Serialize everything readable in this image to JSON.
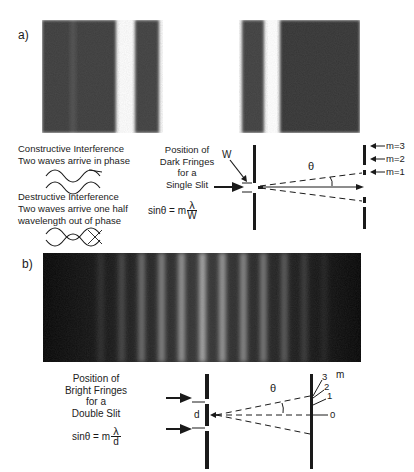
{
  "panel_a": {
    "label": "a)",
    "fringe_image": "single-slit diffraction pattern",
    "constructive": {
      "title": "Constructive Interference",
      "subtitle": "Two waves arrive in phase"
    },
    "destructive": {
      "title": "Destructive Interference",
      "subtitle_line1": "Two waves arrive one half",
      "subtitle_line2": "wavelength out of phase"
    },
    "caption": {
      "line1": "Position of",
      "line2": "Dark Fringes",
      "line3": "for a",
      "line4": "Single Slit"
    },
    "equation": {
      "lhs": "sinθ = m",
      "numerator": "λ",
      "denominator": "W"
    },
    "diagram": {
      "slit_label": "W",
      "angle_label": "θ",
      "orders": [
        "m=3",
        "m=2",
        "m=1"
      ]
    }
  },
  "panel_b": {
    "label": "b)",
    "fringe_image": "double-slit interference pattern",
    "caption": {
      "line1": "Position of",
      "line2": "Bright Fringes",
      "line3": "for a",
      "line4": "Double Slit"
    },
    "equation": {
      "lhs": "sinθ = m",
      "numerator": "λ",
      "denominator": "d"
    },
    "diagram": {
      "slit_label": "d",
      "angle_label": "θ",
      "order_axis_label": "m",
      "orders": [
        "3",
        "2",
        "1",
        "0"
      ]
    }
  },
  "colors": {
    "dark_fringe": "#3a3a3a",
    "bright_fringe_b": "#9a9a9a",
    "ink": "#1a1a1a",
    "background": "#ffffff"
  }
}
